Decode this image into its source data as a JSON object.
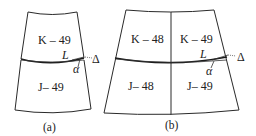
{
  "figure": {
    "panel_a": {
      "caption": "(a)",
      "sheets": [
        {
          "label": "K – 49",
          "position": "upper"
        },
        {
          "label": "J– 49",
          "position": "lower"
        }
      ],
      "annotations": {
        "L": "L",
        "alpha": "α",
        "delta": "Δ"
      }
    },
    "panel_b": {
      "caption": "(b)",
      "sheets": [
        {
          "label": "K – 48",
          "position": "upper-left"
        },
        {
          "label": "K – 49",
          "position": "upper-right"
        },
        {
          "label": "J– 48",
          "position": "lower-left"
        },
        {
          "label": "J– 49",
          "position": "lower-right"
        }
      ],
      "annotations": {
        "L": "L",
        "alpha": "α",
        "delta": "Δ"
      }
    }
  },
  "colors": {
    "line": "#2a2a2a",
    "background": "#ffffff"
  }
}
